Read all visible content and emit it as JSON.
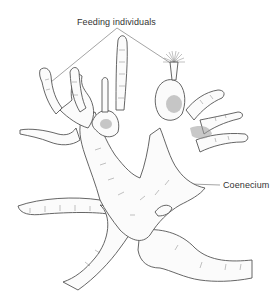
{
  "figure": {
    "labels": {
      "feeding": "Feeding individuals",
      "coenecium": "Coenecium"
    },
    "leader_lines": [
      {
        "target": "feeding",
        "from": [
          117,
          28
        ],
        "to": [
          51,
          82
        ]
      },
      {
        "target": "feeding",
        "from": [
          117,
          28
        ],
        "to": [
          175,
          66
        ]
      },
      {
        "target": "coenecium",
        "from": [
          190,
          184
        ],
        "to": [
          220,
          185
        ]
      }
    ],
    "colors": {
      "background": "#ffffff",
      "ink": "#555555",
      "label_text": "#333333",
      "shading": "#9a9a9a"
    }
  }
}
